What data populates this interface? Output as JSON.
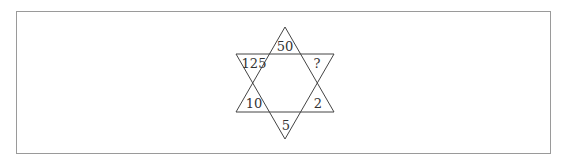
{
  "puzzle": {
    "type": "six-pointed star number puzzle",
    "points": {
      "top": "50",
      "upper_right": "?",
      "lower_right": "2",
      "bottom": "5",
      "lower_left": "10",
      "upper_left": "125"
    }
  },
  "colors": {
    "line": "#444444",
    "frame": "#9a9a9a",
    "text": "#333333",
    "background": "#ffffff"
  }
}
